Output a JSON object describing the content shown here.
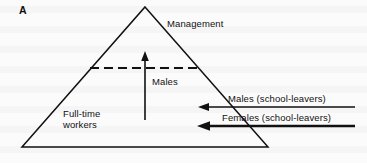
{
  "figure": {
    "panel_label": "A",
    "type": "labelled pyramid diagram of workforce structure"
  },
  "labels": {
    "apex": "Management",
    "internal_arrow": "Males",
    "base_block_line1": "Full-time",
    "base_block_line2": "workers",
    "inflow_top": "Males (school-leavers)",
    "inflow_bottom": "Females (school-leavers)"
  },
  "icons": {
    "up_arrow": "arrow-up-icon",
    "inflow_arrow_top": "arrow-left-icon",
    "inflow_arrow_bottom": "arrow-left-icon"
  },
  "colors": {
    "ink": "#111111",
    "paper": "#fbfbfb"
  },
  "geometry": {
    "triangle": {
      "apex": [
        145,
        7
      ],
      "left_vertex": [
        22,
        147
      ],
      "right_vertex": [
        268,
        147
      ]
    },
    "dashed_divider": {
      "y": 68,
      "x_start": 90,
      "x_end": 199
    },
    "up_arrow": {
      "x": 145,
      "y_tail": 120,
      "y_head": 54
    },
    "inflow_arrows": [
      {
        "y": 107,
        "x_tail": 355,
        "x_head": 199
      },
      {
        "y": 126,
        "x_tail": 355,
        "x_head": 199
      }
    ]
  }
}
